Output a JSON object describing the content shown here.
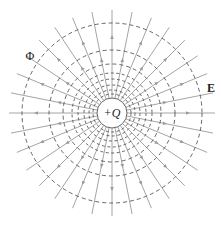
{
  "diagram": {
    "charge_label": "+Q",
    "field_label": "E",
    "potential_label": "Φ",
    "center": [
      112,
      113
    ],
    "charge_radius": 15,
    "equipotential_radii": [
      19,
      23,
      28,
      34,
      40,
      49,
      63,
      90
    ],
    "field_line_count": 32,
    "field_line_outer_radius": 103,
    "arrow_direction": "outward",
    "colors": {
      "field_line": "#9a9a9a",
      "equipotential": "#555555",
      "charge_circle": "#666666",
      "text": "#222222"
    }
  }
}
